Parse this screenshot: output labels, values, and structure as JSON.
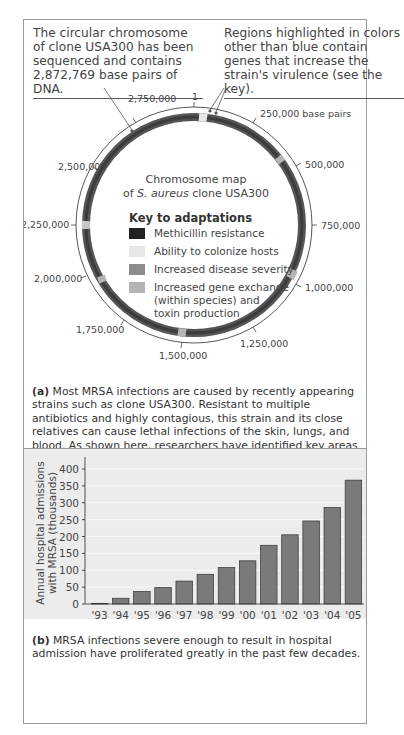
{
  "panel_a": {
    "callout_left": "The circular chromosome of clone USA300 has been sequenced and contains 2,872,769 base pairs of DNA.",
    "callout_right": "Regions highlighted in colors other than blue contain genes that increase the strain's virulence (see the key).",
    "map_title_line1": "Chromosome map",
    "map_title_line2_pre": "of ",
    "map_title_species": "S. aureus",
    "map_title_line2_post": " clone USA300",
    "scale_note": "250,000 base pairs",
    "tick_labels": [
      "1",
      "250,000 base pairs",
      "500,000",
      "750,000",
      "1,000,000",
      "1,250,000",
      "1,500,000",
      "1,750,000",
      "2,000,000",
      "2,250,000",
      "2,500,000",
      "2,750,000"
    ],
    "key_title": "Key to adaptations",
    "key_items": [
      {
        "label": "Methicillin resistance",
        "color": "#222222"
      },
      {
        "label": "Ability to colonize hosts",
        "color": "#e6e6e6"
      },
      {
        "label": "Increased disease severity",
        "color": "#8c8c8c"
      },
      {
        "label": "Increased gene exchange (within species) and toxin production",
        "color": "#b4b4b4"
      }
    ],
    "caption_label": "(a)",
    "caption_text": "Most MRSA infections are caused by recently appearing strains such as clone USA300. Resistant to multiple antibiotics and highly contagious, this strain and its close relatives can cause lethal infections of the skin, lungs, and blood. As shown here, researchers have identified key areas of the USA300 genome that code for adaptations that cause its virulent properties."
  },
  "panel_b": {
    "caption_label": "(b)",
    "caption_text": "MRSA infections severe enough to result in hospital admission have proliferated greatly in the past few decades."
  },
  "chart_data": {
    "type": "bar",
    "title": "",
    "categories": [
      "'93",
      "'94",
      "'95",
      "'96",
      "'97",
      "'98",
      "'99",
      "'00",
      "'01",
      "'02",
      "'03",
      "'04",
      "'05"
    ],
    "values": [
      2,
      17,
      37,
      49,
      68,
      88,
      108,
      128,
      174,
      205,
      246,
      286,
      367
    ],
    "xlabel": "Year",
    "ylabel": "Annual hospital admissions with MRSA (thousands)",
    "ylabel_line1": "Annual hospital admissions",
    "ylabel_line2": "with MRSA (thousands)",
    "yticks": [
      0,
      50,
      100,
      150,
      200,
      250,
      300,
      350,
      400
    ],
    "ylim": [
      0,
      420
    ],
    "grid": true,
    "bar_color": "#7a7a7a",
    "background_color": "#e4e4e4"
  }
}
